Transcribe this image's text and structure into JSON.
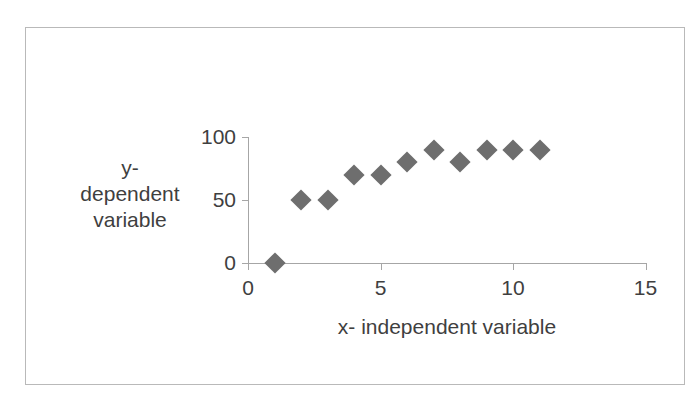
{
  "chart_data": {
    "type": "scatter",
    "title": "",
    "xlabel": "x- independent variable",
    "ylabel": "y-dependent variable",
    "ylabel_lines": [
      "y-",
      "dependent",
      "variable"
    ],
    "x": [
      1,
      2,
      3,
      4,
      5,
      6,
      7,
      8,
      9,
      10,
      11
    ],
    "values": [
      0,
      50,
      50,
      70,
      70,
      80,
      90,
      80,
      90,
      90,
      90
    ],
    "series": [
      {
        "name": "y- dependent variable",
        "points": [
          {
            "x": 1,
            "y": 0
          },
          {
            "x": 2,
            "y": 50
          },
          {
            "x": 3,
            "y": 50
          },
          {
            "x": 4,
            "y": 70
          },
          {
            "x": 5,
            "y": 70
          },
          {
            "x": 6,
            "y": 80
          },
          {
            "x": 7,
            "y": 90
          },
          {
            "x": 8,
            "y": 80
          },
          {
            "x": 9,
            "y": 90
          },
          {
            "x": 10,
            "y": 90
          },
          {
            "x": 11,
            "y": 90
          }
        ]
      }
    ],
    "xlim": [
      0,
      15
    ],
    "ylim": [
      0,
      100
    ],
    "xticks": [
      "0",
      "5",
      "10",
      "15"
    ],
    "xtick_values": [
      0,
      5,
      10,
      15
    ],
    "yticks": [
      "0",
      "50",
      "100"
    ],
    "ytick_values": [
      0,
      50,
      100
    ],
    "grid": false,
    "legend": false,
    "marker": "diamond",
    "marker_color": "#6e6e6e",
    "axis_color": "#a6a6a6",
    "text_color": "#3f3f3f",
    "border_color": "#b9b9b9",
    "background": "#ffffff"
  }
}
